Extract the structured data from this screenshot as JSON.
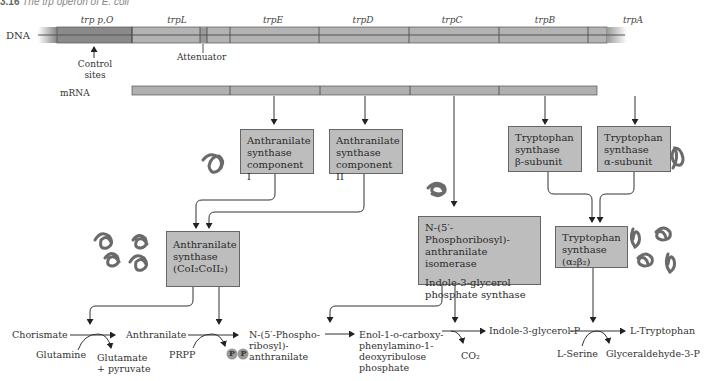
{
  "caption": {
    "figure_num": "3.16",
    "text": "The trp operon of E. coli"
  },
  "dna": {
    "label": "DNA",
    "genes": [
      {
        "name": "trp p,O",
        "x": 97
      },
      {
        "name": "trpL",
        "x": 177
      },
      {
        "name": "trpE",
        "x": 273
      },
      {
        "name": "trpD",
        "x": 363
      },
      {
        "name": "trpC",
        "x": 452
      },
      {
        "name": "trpB",
        "x": 545
      },
      {
        "name": "trpA",
        "x": 633
      }
    ],
    "control_label": [
      "Control",
      "sites"
    ],
    "attenuator_label": "Attenuator"
  },
  "mrna": {
    "label": "mRNA"
  },
  "enzymes": {
    "as_comp1": [
      "Anthranilate",
      "synthase",
      "component I"
    ],
    "as_comp2": [
      "Anthranilate",
      "synthase",
      "component II"
    ],
    "ts_beta": [
      "Tryptophan",
      "synthase",
      "β-subunit"
    ],
    "ts_alpha": [
      "Tryptophan",
      "synthase",
      "α-subunit"
    ],
    "as_complex": [
      "Anthranilate",
      "synthase",
      "(CoI₂CoII₂)"
    ],
    "prai_igps": [
      "N-(5′-Phosphoribosyl)-",
      "anthranilate isomerase",
      "",
      "Indole-3-glycerol",
      "phosphate synthase"
    ],
    "ts_complex": [
      "Tryptophan",
      "synthase",
      "(α₂β₂)"
    ]
  },
  "pathway": {
    "chorismate": "Chorismate",
    "glutamine": "Glutamine",
    "glutamate": [
      "Glutamate",
      "+ pyruvate"
    ],
    "anthranilate": "Anthranilate",
    "prpp": "PRPP",
    "pp": [
      "P",
      "P"
    ],
    "npra": [
      "N-(5′-Phospho-",
      "ribosyl)-",
      "anthranilate"
    ],
    "cdrp": [
      "Enol-1-o-carboxy-",
      "phenylamino-1-",
      "deoxyribulose",
      "phosphate"
    ],
    "co2": "CO₂",
    "igp": "Indole-3-glycerol-P",
    "serine": "L-Serine",
    "g3p": "Glyceraldehyde-3-P",
    "trp": "L-Tryptophan"
  },
  "colors": {
    "bar_dark": "#8a8a8a",
    "bar_light": "#b5b5b5",
    "box_fill": "#bdbdbd",
    "line": "#444444"
  }
}
